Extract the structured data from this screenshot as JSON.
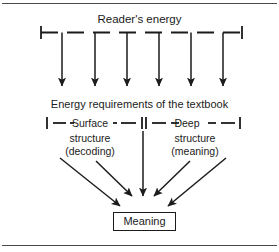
{
  "figure": {
    "title": "Reader's energy",
    "subtitle": "Energy requirements of the textbook",
    "surface_label": "Surface",
    "deep_label": "Deep",
    "surface_line2": "structure",
    "surface_line3": "(decoding)",
    "deep_line2": "structure",
    "deep_line3": "(meaning)",
    "outcome": "Meaning",
    "colors": {
      "ink": "#1b1b1b",
      "rule": "#4a4a4a",
      "background": "#ffffff"
    }
  },
  "diagram_data": {
    "type": "flow-diagram",
    "top_bracket": {
      "label": "Reader's energy",
      "style": "dashed",
      "x_start": 40,
      "x_end": 243,
      "y": 32,
      "tick_count": 2
    },
    "energy_arrows": {
      "count": 6,
      "direction": "down",
      "x_positions": [
        62,
        95,
        127,
        159,
        191,
        223
      ],
      "y_start": 32,
      "y_end": 88
    },
    "requirement_brackets": [
      {
        "name": "surface-structure",
        "label": "Surface",
        "sub_labels": [
          "structure",
          "(decoding)"
        ],
        "x_start": 46,
        "x_end": 143,
        "y": 123,
        "style": "dashed"
      },
      {
        "name": "deep-structure",
        "label": "Deep",
        "sub_labels": [
          "structure",
          "(meaning)"
        ],
        "x_start": 143,
        "x_end": 240,
        "y": 123,
        "style": "dashed"
      }
    ],
    "convergence_arrows": {
      "count": 5,
      "target": "Meaning",
      "paths": [
        {
          "x1": 62,
          "y1": 160,
          "x2": 122,
          "y2": 208
        },
        {
          "x1": 98,
          "y1": 163,
          "x2": 133,
          "y2": 200
        },
        {
          "x1": 143,
          "y1": 140,
          "x2": 143,
          "y2": 200
        },
        {
          "x1": 186,
          "y1": 163,
          "x2": 153,
          "y2": 200
        },
        {
          "x1": 222,
          "y1": 160,
          "x2": 167,
          "y2": 208
        }
      ]
    },
    "outcome_box": {
      "label": "Meaning",
      "x": 113,
      "y": 212,
      "width": 63,
      "height": 19
    }
  }
}
